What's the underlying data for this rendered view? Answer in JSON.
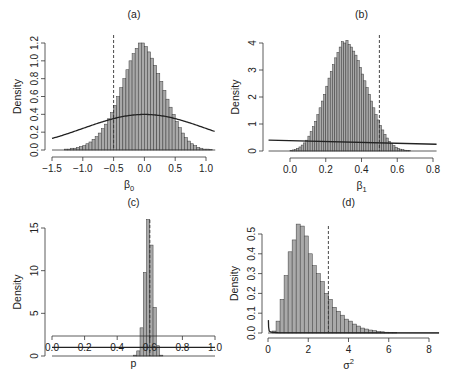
{
  "chart_data": [
    {
      "id": "a",
      "type": "bar",
      "title": "(a)",
      "xlabel": "β",
      "xlabel_sub": "0",
      "ylabel": "Density",
      "xlim": [
        -1.5,
        1.15
      ],
      "ylim": [
        0,
        1.2
      ],
      "xticks": [
        -1.5,
        -1.0,
        -0.5,
        0.0,
        0.5,
        1.0
      ],
      "xtick_labels": [
        "−1.5",
        "−1.0",
        "−0.5",
        "0.0",
        "0.5",
        "1.0"
      ],
      "yticks": [
        0,
        0.2,
        0.4,
        0.6,
        0.8,
        1.0,
        1.2
      ],
      "ytick_labels": [
        "0.0",
        "0.2",
        "0.4",
        "0.6",
        "0.8",
        "1.0",
        "1.2"
      ],
      "histogram": {
        "bin_start": -1.3,
        "bin_width": 0.05,
        "values": [
          0.01,
          0.01,
          0.02,
          0.02,
          0.03,
          0.04,
          0.05,
          0.07,
          0.09,
          0.12,
          0.15,
          0.19,
          0.24,
          0.29,
          0.35,
          0.42,
          0.5,
          0.6,
          0.7,
          0.8,
          0.9,
          1.0,
          1.08,
          1.14,
          1.2,
          1.2,
          1.16,
          1.1,
          1.03,
          0.95,
          0.86,
          0.77,
          0.67,
          0.57,
          0.48,
          0.4,
          0.32,
          0.25,
          0.19,
          0.14,
          0.1,
          0.07,
          0.05,
          0.03,
          0.02,
          0.01,
          0.01,
          0.005
        ]
      },
      "prior_curve": {
        "kind": "normal",
        "mean": 0.0,
        "sd": 1.0
      },
      "reference_line": -0.5,
      "layout": {
        "x0": 52,
        "x1": 206,
        "xv0": -1.5,
        "xv1": 1.0,
        "y0": 150,
        "y1": 43,
        "yv0": 0,
        "yv1": 1.2,
        "axisx": 45,
        "axisy": 157,
        "title_y": 18,
        "plot_left": 52,
        "plot_right": 216
      }
    },
    {
      "id": "b",
      "type": "bar",
      "title": "(b)",
      "xlabel": "β",
      "xlabel_sub": "1",
      "ylabel": "Density",
      "xlim": [
        -0.12,
        0.82
      ],
      "ylim": [
        0,
        4
      ],
      "xticks": [
        0.0,
        0.2,
        0.4,
        0.6,
        0.8
      ],
      "xtick_labels": [
        "0.0",
        "0.2",
        "0.4",
        "0.6",
        "0.8"
      ],
      "yticks": [
        0,
        1,
        2,
        3,
        4
      ],
      "ytick_labels": [
        "0",
        "1",
        "2",
        "3",
        "4"
      ],
      "histogram": {
        "bin_start": 0.0,
        "bin_width": 0.0125,
        "values": [
          0.02,
          0.04,
          0.06,
          0.1,
          0.15,
          0.22,
          0.3,
          0.4,
          0.55,
          0.72,
          0.9,
          1.1,
          1.35,
          1.6,
          1.85,
          2.1,
          2.4,
          2.7,
          2.95,
          3.2,
          3.45,
          3.65,
          3.85,
          4.05,
          4.0,
          4.1,
          3.95,
          3.85,
          3.7,
          3.55,
          3.35,
          3.1,
          2.85,
          2.6,
          2.35,
          2.1,
          1.85,
          1.6,
          1.35,
          1.15,
          0.95,
          0.78,
          0.62,
          0.48,
          0.36,
          0.27,
          0.2,
          0.14,
          0.1,
          0.07,
          0.05,
          0.03,
          0.02,
          0.01
        ]
      },
      "prior_curve": {
        "kind": "line",
        "y_at_xmin": 0.4,
        "y_at_xmax": 0.25
      },
      "reference_line": 0.5,
      "layout": {
        "x0": 290,
        "x1": 433,
        "xv0": 0.0,
        "xv1": 0.8,
        "y0": 151,
        "y1": 43,
        "yv0": 0,
        "yv1": 4,
        "axisx": 263,
        "axisy": 158,
        "title_y": 18,
        "plot_left": 269,
        "plot_right": 435
      }
    },
    {
      "id": "c",
      "type": "bar",
      "title": "(c)",
      "xlabel": "p",
      "xlabel_sub": "",
      "ylabel": "Density",
      "xlim": [
        0.0,
        1.0
      ],
      "ylim": [
        0,
        15
      ],
      "xticks": [
        0.0,
        0.2,
        0.4,
        0.6,
        0.8,
        1.0
      ],
      "xtick_labels": [
        "0.0",
        "0.2",
        "0.4",
        "0.6",
        "0.8",
        "1.0"
      ],
      "yticks": [
        0,
        5,
        10,
        15
      ],
      "ytick_labels": [
        "0",
        "5",
        "10",
        "15"
      ],
      "histogram": {
        "bin_start": 0.5,
        "bin_width": 0.02,
        "values": [
          0.1,
          0.6,
          3.3,
          9.8,
          16.0,
          13.0,
          5.7,
          1.2,
          0.1
        ]
      },
      "prior_curve": {
        "kind": "line",
        "y_at_xmin": 1.0,
        "y_at_xmax": 1.0
      },
      "reference_line": 0.6,
      "layout": {
        "x0": 52,
        "x1": 215,
        "xv0": 0.0,
        "xv1": 1.0,
        "y0": 356,
        "y1": 228,
        "yv0": 0,
        "yv1": 15,
        "axisx": 45,
        "axisy": 336,
        "title_y": 206,
        "plot_left": 52,
        "plot_right": 216
      }
    },
    {
      "id": "d",
      "type": "bar",
      "title": "(d)",
      "xlabel": "σ",
      "xlabel_sup": "2",
      "ylabel": "Density",
      "xlim": [
        0,
        8.5
      ],
      "ylim": [
        0,
        0.5
      ],
      "xticks": [
        0,
        2,
        4,
        6,
        8
      ],
      "xtick_labels": [
        "0",
        "2",
        "4",
        "6",
        "8"
      ],
      "yticks": [
        0.0,
        0.1,
        0.2,
        0.3,
        0.4,
        0.5
      ],
      "ytick_labels": [
        "0.0",
        "0.1",
        "0.2",
        "0.3",
        "0.4",
        "0.5"
      ],
      "histogram": {
        "bin_start": 0.0,
        "bin_width": 0.2,
        "values": [
          0.0,
          0.01,
          0.06,
          0.17,
          0.29,
          0.41,
          0.47,
          0.55,
          0.54,
          0.49,
          0.4,
          0.34,
          0.3,
          0.26,
          0.2,
          0.17,
          0.13,
          0.11,
          0.09,
          0.07,
          0.06,
          0.045,
          0.035,
          0.025,
          0.02,
          0.015,
          0.012,
          0.008,
          0.006,
          0.004,
          0.003,
          0.002
        ]
      },
      "prior_curve": {
        "kind": "invgamma_spike"
      },
      "reference_line": 3.0,
      "layout": {
        "x0": 268,
        "x1": 429,
        "xv0": 0,
        "xv1": 8,
        "y0": 333,
        "y1": 234,
        "yv0": 0,
        "yv1": 0.5,
        "axisx": 262,
        "axisy": 338,
        "title_y": 206,
        "plot_left": 268,
        "plot_right": 440
      }
    }
  ]
}
